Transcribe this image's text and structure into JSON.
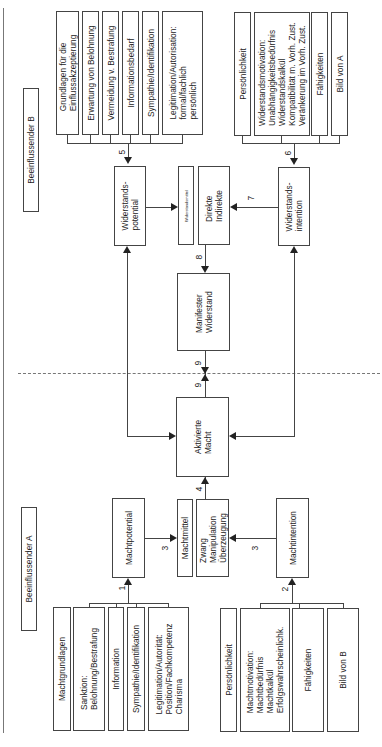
{
  "sections": {
    "party_b_label": "Beeinflussender B",
    "party_a_label": "Beeinflussender A"
  },
  "party_b": {
    "grundlagen": [
      "Grundlagen für die\nEinflussakzeptierung",
      "Erwartung von Belohnung",
      "Vermeidung v. Bestrafung",
      "Informationsbedarf",
      "Sympathie/Identifikation",
      "Legitimation/Autorisation:\nformal/fachlich\npersönlich"
    ],
    "intention_factors": [
      "Persönlichkeit",
      "Widerstandsmotivation:\nUnabhängigkeitsbedürfnis\nWiderstandskalkül\nKompatibilität m. Vorh. Zust.\nVeränkerung im Vorh. Zust.",
      "Fähigkeiten",
      "Bild von A"
    ],
    "widerstandspotential": "Widerstands-\npotential",
    "widerstandsmittel_label": "Widerstandsmittel",
    "widerstandsmittel": "Direkte\nIndirekte",
    "widerstandsintention": "Widerstands-\nintention",
    "manifester_widerstand": "Manifester\nWiderstand"
  },
  "party_a": {
    "aktivierte_macht": "Aktivierte\nMacht",
    "machtpotential": "Machtpotential",
    "machtmittel_label": "Machtmittel",
    "machtmittel": "Zwang\nManipulation\nÜberzeugung",
    "machtintention": "Machtintention",
    "grundlagen": [
      "Machtgrundlagen",
      "Sanktion:\nBelohnung/Bestrafung",
      "Information",
      "Sympathie/Identifikation",
      "Legitimation/Autorität:\nPosition/Fachkompetenz\nCharisma"
    ],
    "intention_factors": [
      "Persönlichkeit",
      "Machtmotivation:\nMachtbedürfnis\nMachtkalkül\nErfolgswahrscheinlichk.",
      "Fähigkeiten",
      "Bild von B"
    ]
  },
  "edge_labels": {
    "e1": "1",
    "e2": "2",
    "e3a": "3",
    "e3b": "3",
    "e4": "4",
    "e5": "5",
    "e6": "6",
    "e7": "7",
    "e8": "8",
    "e9a": "9",
    "e9b": "9"
  }
}
